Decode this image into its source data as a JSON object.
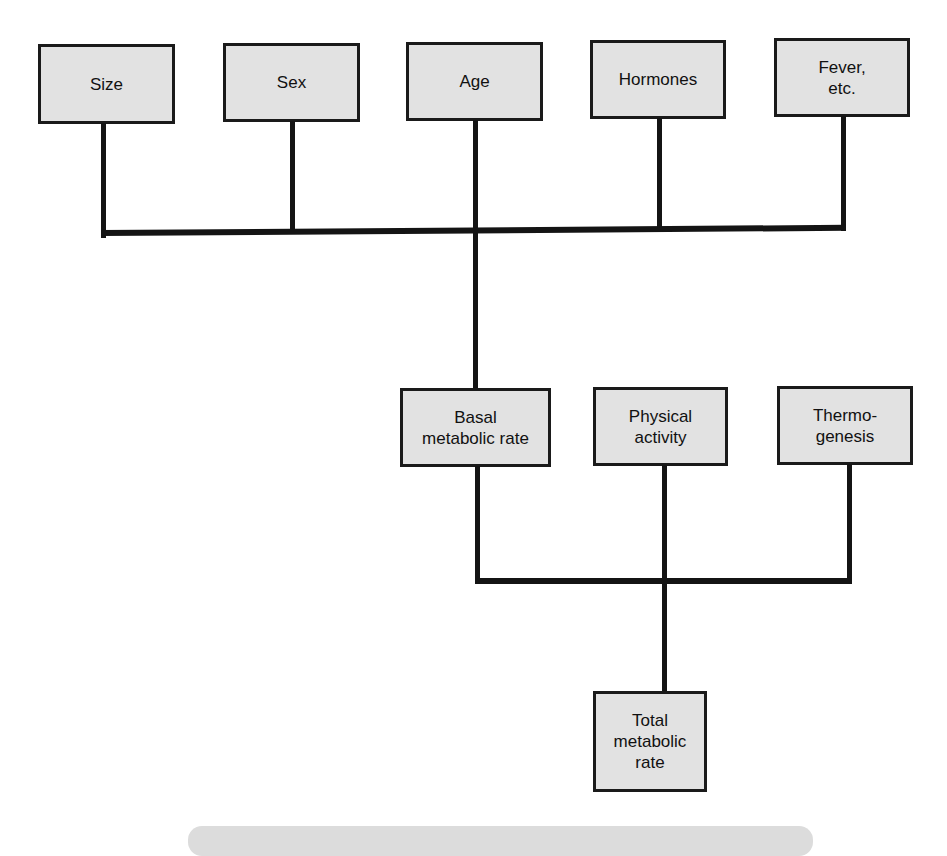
{
  "diagram": {
    "colors": {
      "box_fill": "#e2e2e2",
      "box_border": "#1a1a1a",
      "connector": "#141414",
      "background": "#ffffff"
    },
    "top_row": [
      {
        "id": "size",
        "label": "Size"
      },
      {
        "id": "sex",
        "label": "Sex"
      },
      {
        "id": "age",
        "label": "Age"
      },
      {
        "id": "hormones",
        "label": "Hormones"
      },
      {
        "id": "fever",
        "label": "Fever,\netc."
      }
    ],
    "middle_row": [
      {
        "id": "bmr",
        "label": "Basal\nmetabolic rate"
      },
      {
        "id": "physical",
        "label": "Physical\nactivity"
      },
      {
        "id": "thermo",
        "label": "Thermo-\ngenesis"
      }
    ],
    "result": {
      "id": "total",
      "label": "Total\nmetabolic\nrate"
    },
    "edges": [
      {
        "from": [
          "size",
          "sex",
          "age",
          "hormones",
          "fever"
        ],
        "to": "bmr"
      },
      {
        "from": [
          "bmr",
          "physical",
          "thermo"
        ],
        "to": "total"
      }
    ]
  }
}
